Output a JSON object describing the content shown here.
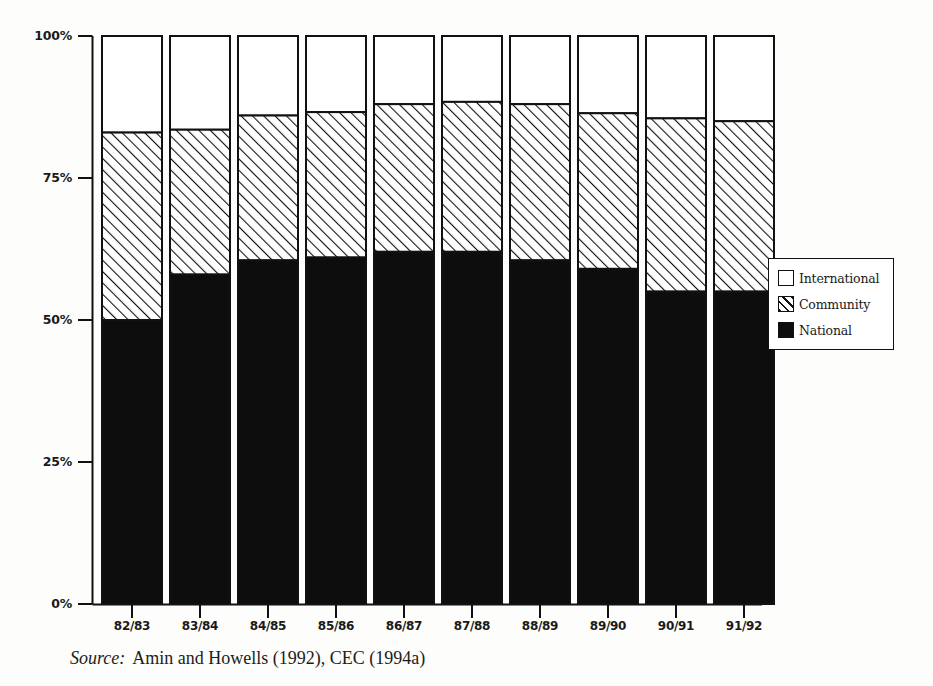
{
  "chart_data": {
    "type": "bar",
    "subtype": "stacked-percentage-column",
    "title": "",
    "subtitle": "",
    "xlabel": "",
    "ylabel": "",
    "ylim": [
      0,
      100
    ],
    "y_unit": "%",
    "grid": false,
    "legend_position": "right",
    "categories": [
      "82/83",
      "83/84",
      "84/85",
      "85/86",
      "86/87",
      "87/88",
      "88/89",
      "89/90",
      "90/91",
      "91/92"
    ],
    "y_ticks": [
      0,
      25,
      50,
      75,
      100
    ],
    "y_tick_labels": [
      "0%",
      "25%",
      "50%",
      "75%",
      "100%"
    ],
    "series": [
      {
        "name": "National",
        "fill": "solid-black",
        "color": "#0d0d0d",
        "values": [
          50.0,
          58.0,
          60.5,
          61.0,
          62.0,
          62.0,
          60.5,
          59.0,
          55.0,
          55.0
        ]
      },
      {
        "name": "Community",
        "fill": "diagonal-hatch",
        "color": "#ffffff",
        "values": [
          33.0,
          25.5,
          25.5,
          25.6,
          26.0,
          26.4,
          27.5,
          27.4,
          30.5,
          30.0
        ]
      },
      {
        "name": "International",
        "fill": "white",
        "color": "#ffffff",
        "values": [
          17.0,
          16.5,
          14.0,
          13.4,
          12.0,
          11.6,
          12.0,
          13.6,
          14.5,
          15.0
        ]
      }
    ],
    "cumulative_tops": {
      "national": [
        50.0,
        58.0,
        60.5,
        61.0,
        62.0,
        62.0,
        60.5,
        59.0,
        55.0,
        55.0
      ],
      "community": [
        83.0,
        83.5,
        86.0,
        86.6,
        88.0,
        88.4,
        88.0,
        86.4,
        85.5,
        85.0
      ]
    },
    "annotations": []
  },
  "legend": {
    "items": [
      {
        "label": "International",
        "swatch": "white"
      },
      {
        "label": "Community",
        "swatch": "hatch"
      },
      {
        "label": "National",
        "swatch": "solid"
      }
    ]
  },
  "source": {
    "prefix": "Source:",
    "text": "Amin and Howells (1992), CEC (1994a)"
  },
  "colors": {
    "ink": "#111111",
    "national": "#0d0d0d",
    "community_line": "#111111",
    "international": "#ffffff",
    "page_background": "#fdfdfb"
  }
}
